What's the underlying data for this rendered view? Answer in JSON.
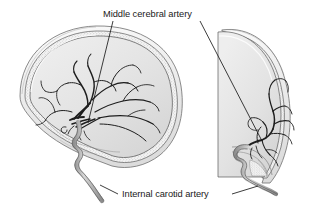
{
  "figure": {
    "type": "anatomical-illustration",
    "background_color": "#ffffff",
    "views": [
      {
        "id": "lateral-view",
        "name": "Lateral (side) view of skull and cerebral arteries",
        "position": "left"
      },
      {
        "id": "frontal-view",
        "name": "Frontal (anteroposterior) view of skull and cerebral arteries",
        "position": "right"
      }
    ],
    "labels": [
      {
        "id": "middle-cerebral-artery",
        "text": "Middle cerebral artery",
        "x": 103,
        "y": 17,
        "anchor": "start",
        "leaders": 2
      },
      {
        "id": "internal-carotid-artery",
        "text": "Internal carotid artery",
        "x": 122,
        "y": 197,
        "anchor": "start",
        "leaders": 2
      }
    ],
    "colors": {
      "background": "#ffffff",
      "artery_dark": "#1e1e1e",
      "artery_vessel_fill": "#bdbdbd",
      "artery_vessel_stroke": "#4a4a4a",
      "brain_fill": "#e6e6e6",
      "brain_shade": "#d4d4d4",
      "skull_fill": "#f2f2f2",
      "skull_stroke": "#6e6e6e",
      "diploe_stipple": "#8a8a8a",
      "label_color": "#1a1a1a",
      "leader_line": "#1a1a1a"
    }
  }
}
